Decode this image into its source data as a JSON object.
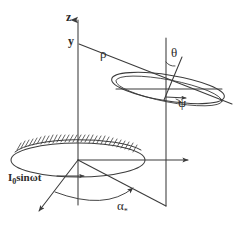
{
  "figure": {
    "stroke_color": "#3b3b3b",
    "background": "#ffffff",
    "labels": {
      "z_axis": "z",
      "y_axis": "y",
      "rho": "ρ",
      "theta": "θ",
      "psi": "ψ",
      "alpha_base": "α",
      "alpha_sub": "*",
      "source_main": "I",
      "source_sub": "0",
      "source_rest": "sinωt"
    },
    "elements": {
      "vertical_axis": "z-axis vertical arrow",
      "secondary_vertical": "secondary vertical reference line",
      "horizontal_axis": "horizontal arrow axis",
      "upper_ellipse": "tilted precession ellipse",
      "lower_ellipse": "hatched source disk",
      "alpha_arc": "azimuth angle arc",
      "rho_line": "radius vector rho",
      "theta_line": "polar angle line theta",
      "down_left_arrow": "down-left direction arrow",
      "down_right_line": "down-right direction line",
      "hatching": "hatched rim of lower disk"
    }
  }
}
